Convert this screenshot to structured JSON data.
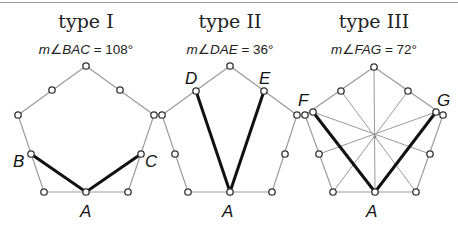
{
  "panels": [
    {
      "title": "type I",
      "measure_prefix": "m∠",
      "angle_name": "BAC",
      "measure_suffix": " = 108°",
      "angle_degrees": 108,
      "labels": {
        "B": "B",
        "C": "C",
        "A": "A"
      }
    },
    {
      "title": "type II",
      "measure_prefix": "m∠",
      "angle_name": "DAE",
      "measure_suffix": " = 36°",
      "angle_degrees": 36,
      "labels": {
        "D": "D",
        "E": "E",
        "A": "A"
      }
    },
    {
      "title": "type III",
      "measure_prefix": "m∠",
      "angle_name": "FAG",
      "measure_suffix": " = 72°",
      "angle_degrees": 72,
      "labels": {
        "F": "F",
        "G": "G",
        "A": "A"
      }
    }
  ],
  "colors": {
    "polygon_edge": "#9a9a9a",
    "highlight": "#111111",
    "point_fill": "#ffffff",
    "point_stroke": "#333333"
  }
}
